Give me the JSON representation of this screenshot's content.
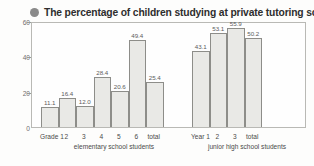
{
  "title": {
    "bullet_icon": "filled-circle-bullet",
    "text": "The percentage of children studying at private tutoring schools"
  },
  "colors": {
    "bar_fill": "#e9e9e6",
    "bar_stroke": "#8d8d89",
    "frame": "#b9b9b5",
    "bullet": "#8a8a8a",
    "text": "#3d3d3d"
  },
  "chart_data": {
    "type": "bar",
    "title": "The percentage of children studying at private tutoring schools",
    "xlabel": "",
    "ylabel": "",
    "ylim": [
      0,
      60
    ],
    "yticks": [
      0,
      20,
      40,
      60
    ],
    "ytick_labels": [
      "0",
      "20",
      "40",
      "60"
    ],
    "grid": false,
    "legend": "none",
    "groups": [
      {
        "name": "elementary school students",
        "caption": "elementary school students",
        "categories": [
          "Grade 1",
          "2",
          "3",
          "4",
          "5",
          "6",
          "total"
        ],
        "values": [
          11.1,
          16.4,
          12.0,
          28.4,
          20.6,
          49.4,
          25.4
        ],
        "labels": [
          "11.1",
          "16.4",
          "12.0",
          "28.4",
          "20.6",
          "49.4",
          "25.4"
        ]
      },
      {
        "name": "junior high school students",
        "caption": "junior high school students",
        "categories": [
          "Year 1",
          "2",
          "3",
          "total"
        ],
        "values": [
          43.1,
          53.1,
          55.9,
          50.2
        ],
        "labels": [
          "43.1",
          "53.1",
          "55.9",
          "50.2"
        ]
      }
    ]
  }
}
